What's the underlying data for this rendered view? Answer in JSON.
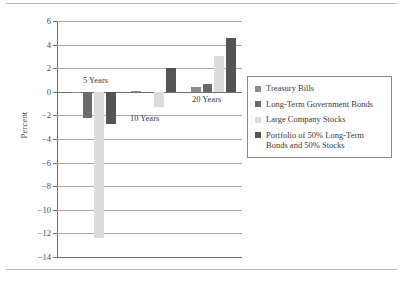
{
  "chart_data": {
    "type": "bar",
    "title": "",
    "subtitle": "",
    "xlabel": "",
    "ylabel": "Percent",
    "ylim": [
      -14,
      6
    ],
    "yticks": [
      6,
      4,
      2,
      0,
      -2,
      -4,
      -6,
      -8,
      -10,
      -12,
      -14
    ],
    "ytick_labels": [
      "6",
      "4",
      "2",
      "0",
      "−2",
      "−4",
      "−6",
      "−8",
      "−10",
      "−12",
      "−14"
    ],
    "grid": "horizontal",
    "legend_position": "right",
    "categories": [
      "5 Years",
      "10 Years",
      "20 Years"
    ],
    "series": [
      {
        "name": "Treasury Bills",
        "color": "#8d8d8d",
        "values": [
          0.0,
          0.1,
          0.4
        ]
      },
      {
        "name": "Long-Term Government Bonds",
        "color": "#6b6b6b",
        "values": [
          -2.2,
          -0.05,
          0.7
        ]
      },
      {
        "name": "Large Company Stocks",
        "color": "#dcdcdc",
        "values": [
          -12.4,
          -1.3,
          3.05
        ]
      },
      {
        "name": "Portfolio of 50% Long-Term Bonds and 50% Stocks",
        "color": "#545454",
        "values": [
          -2.7,
          2.0,
          4.6
        ]
      }
    ],
    "annotations": [
      {
        "text": "5 Years",
        "x": 83,
        "y": 75
      },
      {
        "text": "10 Years",
        "x": 130,
        "y": 113
      },
      {
        "text": "20 Years",
        "x": 192,
        "y": 94
      }
    ]
  },
  "legend": {
    "items": [
      {
        "label": "Treasury Bills",
        "color": "#8d8d8d"
      },
      {
        "label": "Long-Term Government Bonds",
        "color": "#6b6b6b"
      },
      {
        "label": "Large Company Stocks",
        "color": "#dcdcdc"
      },
      {
        "label": "Portfolio of 50% Long-Term Bonds and 50% Stocks",
        "color": "#545454"
      }
    ]
  }
}
